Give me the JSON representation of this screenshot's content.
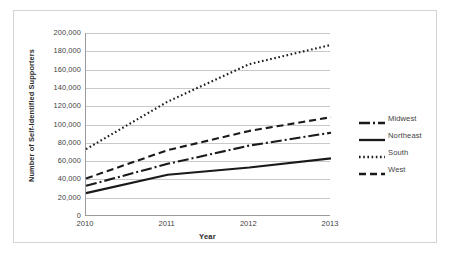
{
  "chart_data": {
    "type": "line",
    "title": "",
    "xlabel": "Year",
    "ylabel": "Number of Self-Identified Supporters",
    "categories": [
      "2010",
      "2011",
      "2012",
      "2013"
    ],
    "x": [
      2010,
      2011,
      2012,
      2013
    ],
    "xlim": [
      2010,
      2013
    ],
    "ylim": [
      0,
      200000
    ],
    "ytick_step": 20000,
    "ytick_labels": [
      "200,000",
      "180,000",
      "160,000",
      "140,000",
      "120,000",
      "100,000",
      "80,000",
      "60,000",
      "40,000",
      "20,000",
      "0"
    ],
    "ytick_values": [
      200000,
      180000,
      160000,
      140000,
      120000,
      100000,
      80000,
      60000,
      40000,
      20000,
      0
    ],
    "xtick_labels": [
      "2010",
      "2011",
      "2012",
      "2013"
    ],
    "grid": "horizontal",
    "legend_position": "right",
    "series": [
      {
        "name": "Midwest",
        "values": [
          33000,
          57000,
          77000,
          91000
        ],
        "style": "dash-dot",
        "color": "#1a1a1a",
        "dasharray": "11,3,2,3",
        "width": 2.1
      },
      {
        "name": "Northeast",
        "values": [
          25000,
          45000,
          53000,
          63000
        ],
        "style": "solid",
        "color": "#1a1a1a",
        "dasharray": "none",
        "width": 2.1
      },
      {
        "name": "South",
        "values": [
          73000,
          125000,
          166000,
          187000
        ],
        "style": "dotted",
        "color": "#1a1a1a",
        "dasharray": "1.6,2.6",
        "width": 2.1
      },
      {
        "name": "West",
        "values": [
          41000,
          72000,
          93000,
          108000
        ],
        "style": "dashed",
        "color": "#1a1a1a",
        "dasharray": "7,4",
        "width": 2.1
      }
    ]
  },
  "axis": {
    "x_title": "Year",
    "y_title": "Number of Self-Identified Supporters"
  },
  "legend": {
    "items": [
      {
        "label": "Midwest"
      },
      {
        "label": "Northeast"
      },
      {
        "label": "South"
      },
      {
        "label": "West"
      }
    ]
  },
  "colors": {
    "line": "#1a1a1a",
    "grid": "#c9c9c9",
    "axis": "#9a9a9a",
    "frame": "#d4d4d4",
    "text": "#3f3f3f",
    "title_text": "#2b2b2b",
    "background": "#ffffff"
  }
}
